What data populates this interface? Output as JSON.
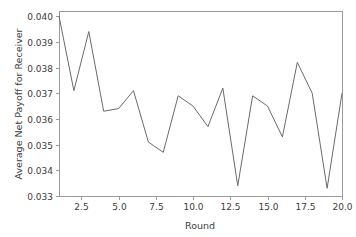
{
  "chart_data": {
    "type": "line",
    "title": "",
    "xlabel": "Round",
    "ylabel": "Average Net Payoff for Receiver",
    "x": [
      1,
      2,
      3,
      4,
      5,
      6,
      7,
      8,
      9,
      10,
      11,
      12,
      13,
      14,
      15,
      16,
      17,
      18,
      19,
      20
    ],
    "values": [
      0.04,
      0.0371,
      0.0394,
      0.0363,
      0.0364,
      0.0371,
      0.0351,
      0.0347,
      0.0369,
      0.0365,
      0.0357,
      0.0372,
      0.0334,
      0.0369,
      0.0365,
      0.0353,
      0.0382,
      0.037,
      0.0333,
      0.037
    ],
    "series": [
      {
        "name": "Average Net Payoff for Receiver",
        "values": [
          0.04,
          0.0371,
          0.0394,
          0.0363,
          0.0364,
          0.0371,
          0.0351,
          0.0347,
          0.0369,
          0.0365,
          0.0357,
          0.0372,
          0.0334,
          0.0369,
          0.0365,
          0.0353,
          0.0382,
          0.037,
          0.0333,
          0.037
        ]
      }
    ],
    "xlim": [
      1,
      20
    ],
    "ylim": [
      0.033,
      0.0402
    ],
    "xticks": [
      2.5,
      5.0,
      7.5,
      10.0,
      12.5,
      15.0,
      17.5,
      20.0
    ],
    "xtick_labels": [
      "2.5",
      "5.0",
      "7.5",
      "10.0",
      "12.5",
      "15.0",
      "17.5",
      "20.0"
    ],
    "yticks": [
      0.033,
      0.034,
      0.035,
      0.036,
      0.037,
      0.038,
      0.039,
      0.04
    ],
    "ytick_labels": [
      "0.033",
      "0.034",
      "0.035",
      "0.036",
      "0.037",
      "0.038",
      "0.039",
      "0.040"
    ],
    "grid": false,
    "legend": false,
    "legend_position": "none",
    "line_color": "#6b6b6b",
    "axis_color": "#9a9a9a",
    "background_color": "#ffffff"
  }
}
